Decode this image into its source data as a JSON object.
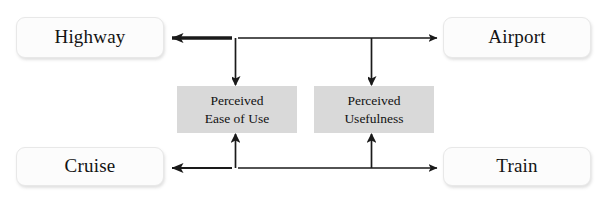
{
  "diagram": {
    "type": "flow-diagram",
    "canvas": {
      "width": 606,
      "height": 200,
      "background": "#ffffff"
    },
    "colors": {
      "node_fill": "#fcfcfc",
      "node_border": "#e8e8e8",
      "mediator_fill": "#d9d9d9",
      "arrow_stroke": "#1a1a1a",
      "text": "#131313"
    },
    "nodes": [
      {
        "id": "highway",
        "label": "Highway",
        "role": "travel-mode",
        "position": "top-left"
      },
      {
        "id": "airport",
        "label": "Airport",
        "role": "travel-mode",
        "position": "top-right"
      },
      {
        "id": "cruise",
        "label": "Cruise",
        "role": "travel-mode",
        "position": "bottom-left"
      },
      {
        "id": "train",
        "label": "Train",
        "role": "travel-mode",
        "position": "bottom-right"
      }
    ],
    "mediators": [
      {
        "id": "perceived-ease-of-use",
        "line1": "Perceived",
        "line2": "Ease of Use",
        "full_label": "Perceived Ease of Use",
        "position": "center-left"
      },
      {
        "id": "perceived-usefulness",
        "line1": "Perceived",
        "line2": "Usefulness",
        "full_label": "Perceived Usefulness",
        "position": "center-right"
      }
    ],
    "connectors": [
      {
        "id": "top-bidirectional",
        "from": "highway",
        "to": "airport",
        "style": "double-headed-horizontal"
      },
      {
        "id": "bottom-bidirectional",
        "from": "cruise",
        "to": "train",
        "style": "double-headed-horizontal"
      },
      {
        "id": "top-to-ease",
        "from": "top-bidirectional",
        "to": "perceived-ease-of-use",
        "style": "down-arrow"
      },
      {
        "id": "top-to-usefulness",
        "from": "top-bidirectional",
        "to": "perceived-usefulness",
        "style": "down-arrow"
      },
      {
        "id": "bottom-to-ease",
        "from": "bottom-bidirectional",
        "to": "perceived-ease-of-use",
        "style": "up-arrow"
      },
      {
        "id": "bottom-to-usefulness",
        "from": "bottom-bidirectional",
        "to": "perceived-usefulness",
        "style": "up-arrow"
      }
    ]
  }
}
